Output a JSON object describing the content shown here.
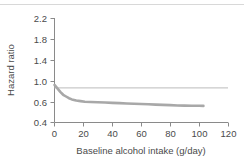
{
  "chart_data": {
    "type": "line",
    "title": "",
    "xlabel": "Baseline alcohol intake (g/day)",
    "ylabel": "Hazard ratio",
    "xlim": [
      0,
      120
    ],
    "ylim": [
      0.4,
      2.2
    ],
    "xticks": [
      0,
      20,
      40,
      60,
      80,
      100,
      120
    ],
    "xtick_labels": [
      "0",
      "20",
      "40",
      "60",
      "80",
      "100",
      "120"
    ],
    "yticks": [
      0.4,
      0.6,
      1.0,
      1.4,
      1.8,
      2.2
    ],
    "ytick_labels": [
      "0.4",
      "0.6",
      "1.0",
      "1.4",
      "1.8",
      "2.2"
    ],
    "grid": false,
    "legend": "none",
    "reference_line": {
      "name": "null-effect-line",
      "y": 1.0,
      "color": "#c9c9c9"
    },
    "series": [
      {
        "name": "Hazard ratio",
        "color": "#a8a8a8",
        "x": [
          0,
          2,
          4,
          6,
          8,
          10,
          12,
          15,
          18,
          21,
          25,
          30,
          35,
          40,
          45,
          50,
          55,
          60,
          65,
          70,
          75,
          80,
          85,
          90,
          95,
          100,
          103
        ],
        "y": [
          1.05,
          0.99,
          0.93,
          0.88,
          0.85,
          0.82,
          0.8,
          0.78,
          0.77,
          0.76,
          0.755,
          0.75,
          0.745,
          0.74,
          0.735,
          0.73,
          0.725,
          0.72,
          0.715,
          0.71,
          0.705,
          0.7,
          0.695,
          0.692,
          0.69,
          0.689,
          0.688
        ]
      }
    ]
  },
  "axis": {
    "y_title": "Hazard ratio",
    "x_title": "Baseline alcohol intake (g/day)"
  }
}
